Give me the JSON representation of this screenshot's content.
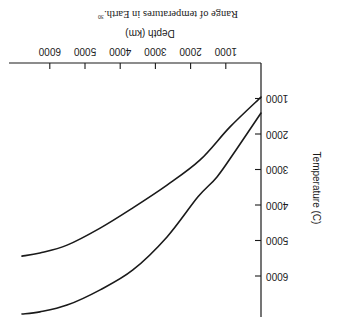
{
  "figure": {
    "caption": "Range of temperatures in Earth.",
    "caption_footnote": "30",
    "orientation": "rotated 180 degrees"
  },
  "chart_data": {
    "type": "line",
    "title": "Range of temperatures in Earth.",
    "footnote_marker": "30",
    "xlabel": "Depth (km)",
    "ylabel": "Temperature (C)",
    "xlim": [
      0,
      6800
    ],
    "ylim": [
      0,
      7300
    ],
    "x_ticks": [
      1000,
      2000,
      3000,
      4000,
      5000,
      6000
    ],
    "y_ticks": [
      1000,
      2000,
      3000,
      4000,
      5000,
      6000
    ],
    "x_tick_labels": [
      "1000",
      "2000",
      "3000",
      "4000",
      "5000",
      "6000"
    ],
    "y_tick_labels": [
      "1000",
      "2000",
      "3000",
      "4000",
      "5000",
      "6000"
    ],
    "grid": false,
    "legend": null,
    "series": [
      {
        "name": "Lower bound",
        "x": [
          0,
          880,
          1730,
          2670,
          3640,
          4570,
          5510,
          6280,
          6790
        ],
        "y": [
          960,
          1800,
          2730,
          3440,
          4080,
          4650,
          5130,
          5350,
          5440
        ]
      },
      {
        "name": "Upper bound",
        "x": [
          0,
          710,
          1250,
          1790,
          2670,
          3640,
          4570,
          5510,
          6280,
          6790
        ],
        "y": [
          1410,
          2450,
          3210,
          3770,
          4900,
          5830,
          6390,
          6820,
          7010,
          7070
        ]
      }
    ]
  },
  "layout_px": {
    "origin_x": 81,
    "origin_y": 268,
    "x_px_per_1000": 35.2,
    "y_px_per_1000": 35.5,
    "x_axis_end": 333,
    "y_axis_end": 14
  }
}
